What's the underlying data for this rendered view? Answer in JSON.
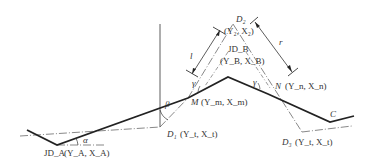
{
  "diagram": {
    "type": "road-alignment-geometry",
    "labels": {
      "d2_name": "D₂",
      "d2_coords": "(Y₂, X₂)",
      "jdb_name": "JD_B",
      "jdb_coords": "(Y_B, X_B)",
      "m_name": "M",
      "m_coords": "(Y_m, X_m)",
      "n_name": "N",
      "n_coords": "(Y_n, X_n)",
      "d1_name": "D₁",
      "d1_coords": "(Y_t, X_t)",
      "d3_name": "D₃",
      "d3_coords": "(Y_t, X_t)",
      "jda_name": "JD_A",
      "jda_coords": "(Y_A, X_A)",
      "c_label": "C",
      "alpha": "α",
      "beta": "β",
      "gamma_left": "γ",
      "gamma_right": "γ",
      "l_dim": "l",
      "r_dim": "r"
    },
    "colors": {
      "line": "#222222",
      "text": "#333333",
      "dashdot": "#555555"
    }
  }
}
